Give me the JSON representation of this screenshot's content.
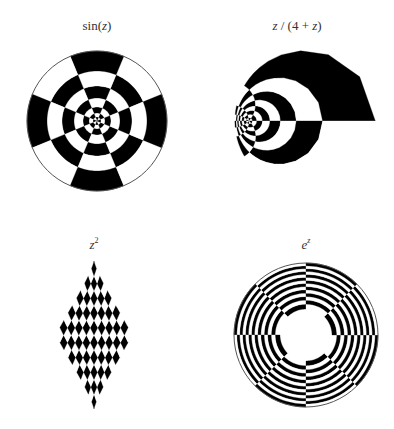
{
  "figure": {
    "background": "#ffffff",
    "fill_dark": "#000000",
    "fill_light": "#ffffff",
    "outline": "#555555",
    "panels": [
      {
        "id": "sin",
        "title_parts": [
          {
            "text": "sin(",
            "italic": false
          },
          {
            "text": "z",
            "italic": true
          },
          {
            "text": ")",
            "italic": false
          }
        ],
        "title_label": "sin(z)",
        "title_x": 97,
        "title_y": 18,
        "function": "sin",
        "center": [
          97,
          121
        ],
        "radius": 70
      },
      {
        "id": "mobius",
        "title_parts": [
          {
            "text": "z",
            "italic": true
          },
          {
            "text": " / (4 + ",
            "italic": false
          },
          {
            "text": "z",
            "italic": true
          },
          {
            "text": ")",
            "italic": false
          }
        ],
        "title_label": "z / (4 + z)",
        "title_x": 297,
        "title_y": 18,
        "function": "z/(4+z)",
        "center": [
          305,
          121
        ],
        "radius": 70
      },
      {
        "id": "square",
        "title_parts": [
          {
            "text": "z",
            "italic": true
          },
          {
            "text": "2",
            "italic": false,
            "sup": true
          }
        ],
        "title_label": "z^2",
        "title_x": 94,
        "title_y": 236,
        "function": "z^2",
        "center": [
          94,
          335
        ],
        "radius": 70
      },
      {
        "id": "exp",
        "title_parts": [
          {
            "text": "e",
            "italic": true
          },
          {
            "text": "z",
            "italic": true,
            "sup": true
          }
        ],
        "title_label": "e^z",
        "title_x": 306,
        "title_y": 236,
        "function": "e^z",
        "center": [
          306,
          335
        ],
        "radius": 72
      }
    ]
  }
}
